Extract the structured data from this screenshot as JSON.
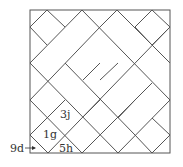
{
  "diagram": {
    "type": "basket-weave tiling of a square with diagonal (45°) rectangles and squares",
    "frame": {
      "x": 30,
      "y": 10,
      "width": 140,
      "height": 143
    },
    "stroke_color": "#555555",
    "labels": [
      {
        "id": "3j",
        "text": "3j",
        "x": 60,
        "y": 109
      },
      {
        "id": "1g",
        "text": "1g",
        "x": 43,
        "y": 129
      },
      {
        "id": "5h",
        "text": "5h",
        "x": 59,
        "y": 143
      },
      {
        "id": "9d",
        "text": "9d",
        "x": 10,
        "y": 143
      }
    ],
    "arrow": {
      "from_label": "9d",
      "x1": 25,
      "y1": 148,
      "x2": 36,
      "y2": 148
    }
  }
}
